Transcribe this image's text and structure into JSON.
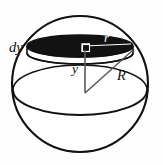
{
  "figure": {
    "background_color": "#fdfdfd",
    "outline_color": "#111111",
    "slab_fill_color": "#121212",
    "light_label_color": "#ffffff",
    "labels": {
      "dy": "dy",
      "r": "r",
      "y": "y",
      "R": "R"
    },
    "geometry": {
      "sphere_center_x": 80,
      "sphere_center_y": 84,
      "sphere_radius": 68,
      "slab_center_y": 46,
      "slab_thickness": 7,
      "slab_rx": 53,
      "slab_ry": 11,
      "equator_rx": 67,
      "equator_ry": 25
    }
  }
}
